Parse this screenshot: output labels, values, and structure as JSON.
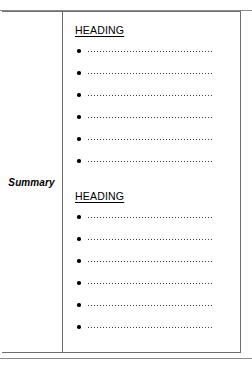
{
  "page": {
    "background_color": "#ffffff",
    "rule_color": "#8c8c8c",
    "border_color": "#6e6e6e"
  },
  "table": {
    "label_cell": {
      "text": "Summary"
    },
    "content_cell": {
      "sections": [
        {
          "heading": "HEADING",
          "bullets": [
            {
              "marker": "bullet-dot-icon",
              "leader": "dotted-leader-line"
            },
            {
              "marker": "bullet-dot-icon",
              "leader": "dotted-leader-line"
            },
            {
              "marker": "bullet-dot-icon",
              "leader": "dotted-leader-line"
            },
            {
              "marker": "bullet-dot-icon",
              "leader": "dotted-leader-line"
            },
            {
              "marker": "bullet-dot-icon",
              "leader": "dotted-leader-line"
            },
            {
              "marker": "bullet-dot-icon",
              "leader": "dotted-leader-line"
            }
          ]
        },
        {
          "heading": "HEADING",
          "bullets": [
            {
              "marker": "bullet-dot-icon",
              "leader": "dotted-leader-line"
            },
            {
              "marker": "bullet-dot-icon",
              "leader": "dotted-leader-line"
            },
            {
              "marker": "bullet-dot-icon",
              "leader": "dotted-leader-line"
            },
            {
              "marker": "bullet-dot-icon",
              "leader": "dotted-leader-line"
            },
            {
              "marker": "bullet-dot-icon",
              "leader": "dotted-leader-line"
            },
            {
              "marker": "bullet-dot-icon",
              "leader": "dotted-leader-line"
            }
          ]
        }
      ]
    }
  }
}
